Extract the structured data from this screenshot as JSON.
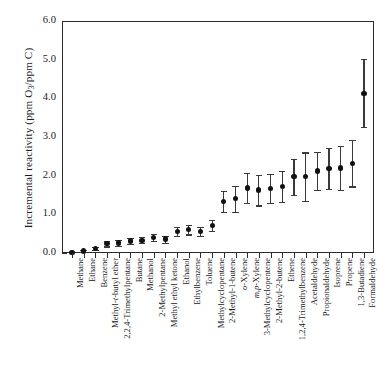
{
  "chart_data": {
    "type": "scatter",
    "title": "",
    "xlabel": "",
    "ylabel": "Incremental reactivity (ppm O3/ppm C)",
    "ylim": [
      0.0,
      6.0
    ],
    "ytick_labels": [
      "0.0",
      "1.0",
      "2.0",
      "3.0",
      "4.0",
      "5.0",
      "6.0"
    ],
    "ytick_values": [
      0.0,
      1.0,
      2.0,
      3.0,
      4.0,
      5.0,
      6.0
    ],
    "grid": false,
    "legend": "none",
    "errorbars": "vertical, capped",
    "categories": [
      "Methane",
      "Ethane",
      "Benzene",
      "Methyl-t-butyl ether",
      "2,2,4-Trimethylpentane",
      "Butane",
      "Methanol",
      "2-Methylpentane",
      "Methyl ethyl ketone",
      "Ethanol",
      "Ethylbenzene",
      "Toluene",
      "Methylcyclopentane",
      "2-Methyl-1-butene",
      "o-Xylene",
      "m,p-Xylene",
      "3-Methylcyclopentene",
      "2-Methyl-2-butene",
      "Ethene",
      "1,2,4-Trimethylbenzene",
      "Acetaldehyde",
      "Propionaldehyde",
      "Isoprene",
      "Propene",
      "1,3-Butadiene",
      "Formaldehyde"
    ],
    "values": [
      0.01,
      0.05,
      0.12,
      0.24,
      0.26,
      0.31,
      0.33,
      0.4,
      0.36,
      0.56,
      0.6,
      0.56,
      0.72,
      1.33,
      1.4,
      1.68,
      1.63,
      1.67,
      1.73,
      1.97,
      1.97,
      2.12,
      2.19,
      2.2,
      2.32,
      4.13
    ],
    "err_low": [
      0.01,
      0.02,
      0.04,
      0.07,
      0.07,
      0.08,
      0.08,
      0.09,
      0.09,
      0.11,
      0.12,
      0.12,
      0.14,
      0.27,
      0.34,
      0.38,
      0.4,
      0.38,
      0.4,
      0.47,
      0.63,
      0.5,
      0.53,
      0.58,
      0.6,
      0.88
    ],
    "err_high": [
      0.01,
      0.02,
      0.04,
      0.07,
      0.07,
      0.08,
      0.08,
      0.09,
      0.09,
      0.11,
      0.12,
      0.12,
      0.14,
      0.27,
      0.34,
      0.38,
      0.4,
      0.38,
      0.4,
      0.47,
      0.63,
      0.5,
      0.53,
      0.58,
      0.6,
      0.88
    ]
  }
}
